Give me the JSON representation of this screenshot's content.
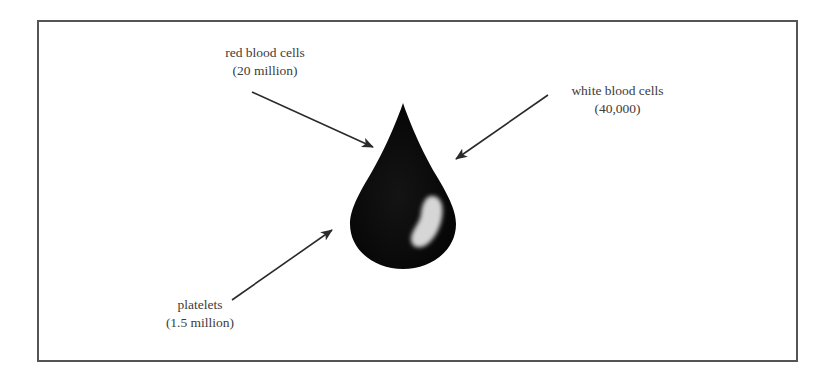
{
  "diagram": {
    "title": "",
    "center_object": {
      "name": "blood drop",
      "color": "#0d0d0d",
      "highlight_color": "#d8d8d8"
    },
    "labels": [
      {
        "id": "red-blood-cells",
        "name": "red blood cells",
        "count": "(20 million)"
      },
      {
        "id": "white-blood-cells",
        "name": "white blood cells",
        "count": "(40,000)"
      },
      {
        "id": "platelets",
        "name": "platelets",
        "count": "(1.5 million)"
      }
    ],
    "colors": {
      "border": "#555555",
      "arrow": "#2a2a2a",
      "text": "#3c3c3c"
    }
  }
}
